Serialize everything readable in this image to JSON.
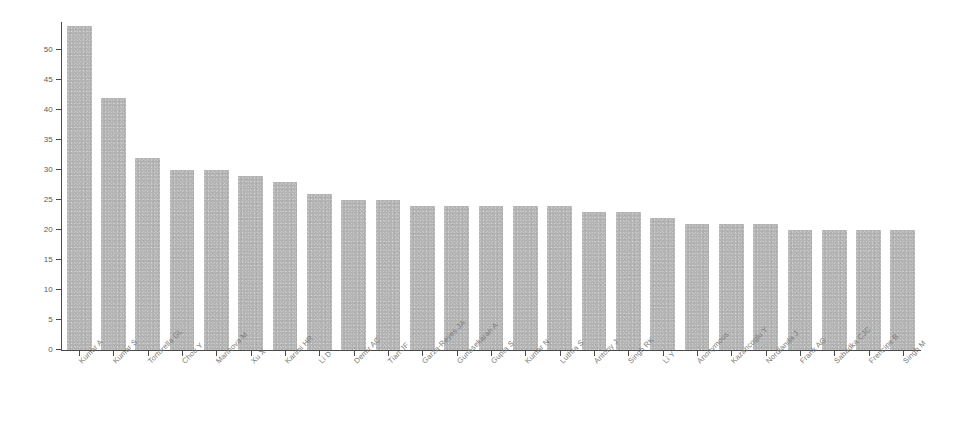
{
  "chart_data": {
    "type": "bar",
    "title": "",
    "subtitle": "",
    "xlabel": "",
    "ylabel": "",
    "orientation": "vertical",
    "grid": false,
    "legend": false,
    "legend_position": "none",
    "bar_color": "#b3b3b3",
    "axis_color": "#4a4a4a",
    "background_color": "#ffffff",
    "label_rotation_degrees": -45,
    "ylim": [
      0,
      55
    ],
    "ytick_labels": [
      "0",
      "5",
      "10",
      "15",
      "20",
      "25",
      "30",
      "35",
      "40",
      "45",
      "50"
    ],
    "ytick_values": [
      0,
      5,
      10,
      15,
      20,
      25,
      30,
      35,
      40,
      45,
      50
    ],
    "categories": [
      "Kumar A",
      "Kumar S",
      "Tortorella GL",
      "Chou Y",
      "Marinova M",
      "Xu X",
      "Karimi HR",
      "Li D",
      "Demir AC",
      "Tian JF",
      "Garza-Reyes JA",
      "Gunasekaran A",
      "Gupta S",
      "Kumar N",
      "Luthra S",
      "Antony J",
      "Singh RK",
      "Li Y",
      "Anonymous",
      "Kazancoglu Y",
      "Nordlanda J",
      "Frank AG",
      "Sabadka CJC",
      "Frencipe B",
      "Singh M"
    ],
    "values": [
      54,
      42,
      32,
      30,
      30,
      29,
      28,
      26,
      25,
      25,
      24,
      24,
      24,
      24,
      24,
      23,
      23,
      22,
      21,
      21,
      21,
      20,
      20,
      20,
      20
    ]
  }
}
